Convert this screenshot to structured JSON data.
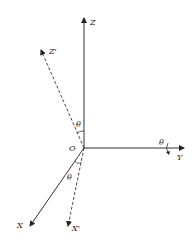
{
  "diagram": {
    "type": "coordinate-rotation",
    "colors": {
      "line": "#333333",
      "text": "#222222",
      "background": "#ffffff"
    },
    "origin": {
      "label": "O",
      "x": 84,
      "y": 148
    },
    "axes": [
      {
        "id": "Z",
        "label": "Z",
        "style": "solid",
        "to": [
          84,
          17
        ]
      },
      {
        "id": "Y",
        "label": "Y",
        "style": "solid",
        "to": [
          185,
          148
        ]
      },
      {
        "id": "X",
        "label": "X",
        "style": "solid",
        "to": [
          29,
          227
        ]
      },
      {
        "id": "Zp",
        "label": "Z'",
        "style": "dashed",
        "to": [
          40,
          49
        ]
      },
      {
        "id": "Xp",
        "label": "X'",
        "style": "dashed",
        "to": [
          68,
          227
        ]
      }
    ],
    "angles": [
      {
        "label": "θ",
        "between": [
          "Z",
          "Z'"
        ]
      },
      {
        "label": "θ",
        "between": [
          "X",
          "X'"
        ]
      },
      {
        "label": "θ",
        "about": "Y",
        "note": "rotation arrow around Y axis"
      }
    ]
  },
  "labels": {
    "z": "Z",
    "z_prime": "Z'",
    "y": "Y",
    "x": "X",
    "x_prime": "X'",
    "origin": "O",
    "theta_top": "θ",
    "theta_bottom": "θ",
    "theta_y": "θ"
  }
}
